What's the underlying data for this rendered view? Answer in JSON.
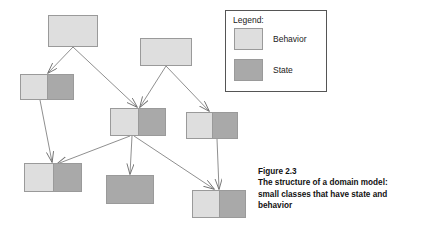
{
  "figure": {
    "caption_lines": [
      "Figure 2.3",
      "The structure of a domain model:",
      "small classes that have state and",
      "behavior"
    ],
    "caption_number": "Figure 2.3",
    "caption_text": "The structure of a domain model: small classes that have state and behavior"
  },
  "legend": {
    "title": "Legend:",
    "items": [
      {
        "label": "Behavior",
        "swatch": "behavior-swatch",
        "color": "#dedede"
      },
      {
        "label": "State",
        "swatch": "state-swatch",
        "color": "#a9a9a9"
      }
    ]
  },
  "colors": {
    "behavior": "#dedede",
    "state": "#a9a9a9",
    "node_border": "#9a9a9a",
    "edge": "#777777",
    "legend_border": "#555555",
    "background": "#ffffff",
    "text": "#1a1a1a"
  },
  "diagram": {
    "type": "domain-model-class-diagram",
    "node_count": 8,
    "edge_count": 9,
    "nodes": [
      {
        "id": "n1",
        "name": "node-top-left",
        "kind": "behavior",
        "x": 48,
        "y": 15,
        "w": 50,
        "h": 32
      },
      {
        "id": "n2",
        "name": "node-top-middle",
        "kind": "behavior",
        "x": 140,
        "y": 38,
        "w": 52,
        "h": 28
      },
      {
        "id": "n3",
        "name": "node-left-upper",
        "kind": "behavior-state",
        "x": 20,
        "y": 74,
        "w": 54,
        "h": 26
      },
      {
        "id": "n4",
        "name": "node-center",
        "kind": "behavior-state",
        "x": 110,
        "y": 108,
        "w": 56,
        "h": 28
      },
      {
        "id": "n5",
        "name": "node-right-middle",
        "kind": "behavior-state",
        "x": 186,
        "y": 112,
        "w": 52,
        "h": 27
      },
      {
        "id": "n6",
        "name": "node-bottom-left",
        "kind": "behavior-state",
        "x": 24,
        "y": 163,
        "w": 58,
        "h": 29
      },
      {
        "id": "n7",
        "name": "node-bottom-middle",
        "kind": "state",
        "x": 106,
        "y": 175,
        "w": 48,
        "h": 29
      },
      {
        "id": "n8",
        "name": "node-bottom-right",
        "kind": "behavior-state",
        "x": 192,
        "y": 190,
        "w": 54,
        "h": 28
      }
    ],
    "edges": [
      {
        "from": "n1",
        "to": "n3"
      },
      {
        "from": "n1",
        "to": "n4"
      },
      {
        "from": "n2",
        "to": "n4"
      },
      {
        "from": "n2",
        "to": "n5"
      },
      {
        "from": "n3",
        "to": "n6"
      },
      {
        "from": "n4",
        "to": "n6"
      },
      {
        "from": "n4",
        "to": "n7"
      },
      {
        "from": "n4",
        "to": "n8"
      },
      {
        "from": "n5",
        "to": "n8"
      }
    ]
  },
  "legend_box": {
    "x": 225,
    "y": 10,
    "w": 102,
    "h": 82
  }
}
